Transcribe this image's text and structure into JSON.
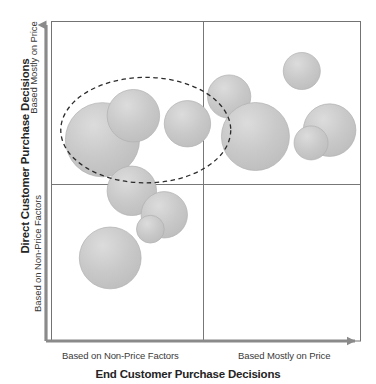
{
  "chart_data": {
    "type": "scatter",
    "title": "",
    "xlabel": "End Customer Purchase Decisions",
    "ylabel": "Direct Customer Purchase Decisions",
    "x_tick_labels": [
      "Based on Non-Price Factors",
      "Based Mostly on Price"
    ],
    "y_tick_labels": [
      "Based on Non-Price Factors",
      "Based Mostly on Price"
    ],
    "xlim": [
      0,
      100
    ],
    "ylim": [
      0,
      100
    ],
    "grid": false,
    "legend": null,
    "quadrant_split": {
      "x": 50,
      "y": 50
    },
    "bubble_color": "#c6c6c6",
    "bubble_edge_color": "#b0b0b0",
    "axis_color": "#8a8a8a",
    "frame_color": "#6f6f6f",
    "annotation_color": "#2b2b2b",
    "series_name": "Product Segments",
    "points": [
      {
        "id": "ul-large",
        "x": 16.5,
        "y": 63.0,
        "r": 12.0,
        "quadrant": "upper-left",
        "highlighted": true
      },
      {
        "id": "ul-medium",
        "x": 26.5,
        "y": 70.5,
        "r": 8.5,
        "quadrant": "upper-left",
        "highlighted": true
      },
      {
        "id": "ul-small",
        "x": 44.0,
        "y": 68.0,
        "r": 7.5,
        "quadrant": "upper-left",
        "highlighted": true
      },
      {
        "id": "ur-top",
        "x": 81.0,
        "y": 84.5,
        "r": 6.0,
        "quadrant": "upper-right",
        "highlighted": false
      },
      {
        "id": "ur-upperleft",
        "x": 57.5,
        "y": 76.5,
        "r": 7.0,
        "quadrant": "upper-right",
        "highlighted": false
      },
      {
        "id": "ur-large",
        "x": 66.0,
        "y": 64.0,
        "r": 11.0,
        "quadrant": "upper-right",
        "highlighted": false
      },
      {
        "id": "ur-right-big",
        "x": 90.0,
        "y": 66.0,
        "r": 8.5,
        "quadrant": "upper-right",
        "highlighted": false
      },
      {
        "id": "ur-right-sm",
        "x": 84.0,
        "y": 62.0,
        "r": 5.5,
        "quadrant": "upper-right",
        "highlighted": false
      },
      {
        "id": "ll-top",
        "x": 26.0,
        "y": 47.0,
        "r": 8.0,
        "quadrant": "lower-left",
        "highlighted": false
      },
      {
        "id": "ll-mid",
        "x": 36.5,
        "y": 39.5,
        "r": 7.5,
        "quadrant": "lower-left",
        "highlighted": false
      },
      {
        "id": "ll-midsmall",
        "x": 32.0,
        "y": 35.0,
        "r": 4.5,
        "quadrant": "lower-left",
        "highlighted": false
      },
      {
        "id": "ll-bottom",
        "x": 19.0,
        "y": 26.0,
        "r": 10.0,
        "quadrant": "lower-left",
        "highlighted": false
      }
    ],
    "annotations": [
      {
        "type": "ellipse",
        "name": "highlight-ellipse",
        "style": "dashed",
        "cx": 30.5,
        "cy": 66.0,
        "rx": 27.5,
        "ry": 16.5,
        "encircles": [
          "ul-large",
          "ul-medium",
          "ul-small"
        ]
      }
    ]
  },
  "axes": {
    "x_title": "End Customer Purchase Decisions",
    "y_title": "Direct Customer Purchase Decisions",
    "x_tick_left": "Based on Non-Price Factors",
    "x_tick_right": "Based Mostly on Price",
    "y_tick_top": "Based Mostly on Price",
    "y_tick_bottom": "Based on Non-Price Factors"
  }
}
